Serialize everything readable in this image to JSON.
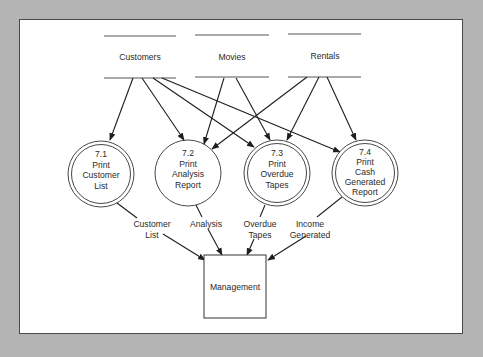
{
  "diagram": {
    "type": "data-flow-diagram",
    "data_stores": [
      {
        "id": "customers",
        "label": "Customers"
      },
      {
        "id": "movies",
        "label": "Movies"
      },
      {
        "id": "rentals",
        "label": "Rentals"
      }
    ],
    "processes": [
      {
        "id": "p71",
        "number": "7.1",
        "lines": [
          "Print",
          "Customer",
          "List"
        ],
        "double_circle": true
      },
      {
        "id": "p72",
        "number": "7.2",
        "lines": [
          "Print",
          "Analysis",
          "Report"
        ],
        "double_circle": false
      },
      {
        "id": "p73",
        "number": "7.3",
        "lines": [
          "Print",
          "Overdue",
          "Tapes"
        ],
        "double_circle": true
      },
      {
        "id": "p74",
        "number": "7.4",
        "lines": [
          "Print",
          "Cash",
          "Generated",
          "Report"
        ],
        "double_circle": true
      }
    ],
    "external_entity": {
      "id": "management",
      "label": "Management"
    },
    "flows": [
      {
        "from": "customers",
        "to": "p71"
      },
      {
        "from": "customers",
        "to": "p72"
      },
      {
        "from": "customers",
        "to": "p73"
      },
      {
        "from": "customers",
        "to": "p74"
      },
      {
        "from": "movies",
        "to": "p72"
      },
      {
        "from": "movies",
        "to": "p73"
      },
      {
        "from": "rentals",
        "to": "p72"
      },
      {
        "from": "rentals",
        "to": "p73"
      },
      {
        "from": "rentals",
        "to": "p74"
      },
      {
        "from": "p71",
        "to": "management",
        "label_lines": [
          "Customer",
          "List"
        ]
      },
      {
        "from": "p72",
        "to": "management",
        "label_lines": [
          "Analysis"
        ]
      },
      {
        "from": "p73",
        "to": "management",
        "label_lines": [
          "Overdue",
          "Tapes"
        ]
      },
      {
        "from": "p74",
        "to": "management",
        "label_lines": [
          "Income",
          "Generated"
        ]
      }
    ]
  }
}
